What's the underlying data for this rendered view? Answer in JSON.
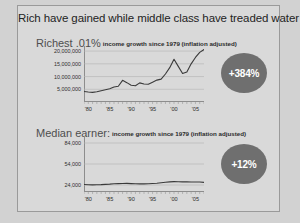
{
  "slide": {
    "headline": "Rich have gained while middle class have treaded water"
  },
  "panels": [
    {
      "title": "Richest .01%",
      "subtitle": "income growth since 1979 (inflation adjusted)",
      "badge": "+384%"
    },
    {
      "title": "Median earner:",
      "subtitle": "income growth since 1979 (inflation adjusted)",
      "badge": "+12%"
    }
  ],
  "colors": {
    "badge_fill": "#6f6f6f",
    "badge_text": "#ffffff",
    "line": "#3a3a3a",
    "slide_background": "#d9d9d9",
    "page_background": "#d2d2d2"
  },
  "chart_data": [
    {
      "type": "line",
      "title": "Richest .01%",
      "subtitle": "income growth since 1979 (inflation adjusted)",
      "xlabel": "",
      "ylabel": "",
      "grid": true,
      "legend": "none",
      "annotation": "+384%",
      "xlim": [
        1979,
        2007
      ],
      "ylim": [
        0,
        22000000
      ],
      "yticks": [
        5000000,
        10000000,
        15000000,
        20000000
      ],
      "ytick_labels": [
        "5,000,000",
        "10,000,000",
        "15,000,000",
        "20,000,000"
      ],
      "xticks": [
        1980,
        1985,
        1990,
        1995,
        2000,
        2005
      ],
      "xtick_labels": [
        "'80",
        "'85",
        "'90",
        "'95",
        "'00",
        "'05"
      ],
      "x": [
        1979,
        1980,
        1981,
        1982,
        1983,
        1984,
        1985,
        1986,
        1987,
        1988,
        1989,
        1990,
        1991,
        1992,
        1993,
        1994,
        1995,
        1996,
        1997,
        1998,
        1999,
        2000,
        2001,
        2002,
        2003,
        2004,
        2005,
        2006,
        2007
      ],
      "values": [
        4100000,
        3900000,
        3800000,
        4000000,
        4400000,
        4800000,
        5200000,
        5900000,
        6200000,
        8500000,
        7600000,
        6600000,
        6400000,
        7500000,
        7100000,
        7000000,
        7800000,
        8600000,
        9000000,
        11000000,
        13500000,
        16800000,
        14000000,
        11200000,
        11800000,
        15000000,
        17500000,
        19500000,
        20600000
      ]
    },
    {
      "type": "line",
      "title": "Median earner:",
      "subtitle": "income growth since 1979 (inflation adjusted)",
      "xlabel": "",
      "ylabel": "",
      "grid": true,
      "legend": "none",
      "annotation": "+12%",
      "xlim": [
        1979,
        2007
      ],
      "ylim": [
        14000,
        94000
      ],
      "yticks": [
        24000,
        54000,
        84000
      ],
      "ytick_labels": [
        "24,000",
        "54,000",
        "84,000"
      ],
      "xticks": [
        1980,
        1985,
        1990,
        1995,
        2000,
        2005
      ],
      "xtick_labels": [
        "'80",
        "'85",
        "'90",
        "'95",
        "'00",
        "'05"
      ],
      "x": [
        1979,
        1980,
        1981,
        1982,
        1983,
        1984,
        1985,
        1986,
        1987,
        1988,
        1989,
        1990,
        1991,
        1992,
        1993,
        1994,
        1995,
        1996,
        1997,
        1998,
        1999,
        2000,
        2001,
        2002,
        2003,
        2004,
        2005,
        2006,
        2007
      ],
      "values": [
        24800,
        24400,
        24200,
        24300,
        24500,
        24900,
        25200,
        25800,
        26000,
        26100,
        26300,
        26000,
        25700,
        25600,
        25600,
        25800,
        26200,
        26600,
        27200,
        27900,
        28500,
        28800,
        28600,
        28500,
        28400,
        28300,
        28200,
        28300,
        27800
      ]
    }
  ]
}
